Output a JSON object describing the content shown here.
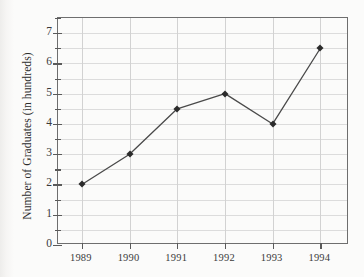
{
  "chart_data": {
    "type": "line",
    "title": "",
    "xlabel": "",
    "ylabel": "Number of Graduates (in hundreds)",
    "categories": [
      "1989",
      "1990",
      "1991",
      "1992",
      "1993",
      "1994"
    ],
    "x": [
      1989,
      1990,
      1991,
      1992,
      1993,
      1994
    ],
    "values": [
      2,
      3,
      4.5,
      5,
      4,
      6.5
    ],
    "series": [
      {
        "name": "Number of Graduates",
        "values": [
          2,
          3,
          4.5,
          5,
          4,
          6.5
        ]
      }
    ],
    "ylim": [
      0,
      7.5
    ],
    "xlim": [
      1988.5,
      1994.6
    ],
    "y_major_ticks": [
      0,
      1,
      2,
      3,
      4,
      5,
      6,
      7
    ],
    "y_minor_ticks": [
      0.5,
      1.5,
      2.5,
      3.5,
      4.5,
      5.5,
      6.5,
      7.5
    ],
    "y_tick_labels": [
      "0",
      "1",
      "2",
      "3",
      "4",
      "5",
      "6",
      "7"
    ],
    "x_tick_labels": [
      "1989",
      "1990",
      "1991",
      "1992",
      "1993",
      "1994"
    ],
    "grid": true,
    "grid_axis": "both",
    "legend": false,
    "legend_position": "none",
    "marker": "square",
    "line_color": "#4a4a4a",
    "marker_color": "#2b2b2b",
    "grid_color": "#dcdcdc",
    "frame_color": "#6e6e6e",
    "background_color": "#fbfbfa"
  }
}
